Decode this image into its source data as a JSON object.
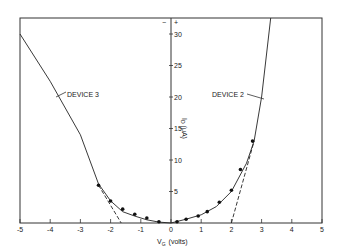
{
  "chart_data": {
    "type": "line",
    "title": "",
    "xlabel": "V_G (volts)",
    "ylabel": "I_D (μA)",
    "xlim": [
      -5,
      5
    ],
    "ylim": [
      0,
      32
    ],
    "x_ticks": [
      "-5",
      "-4",
      "-3",
      "-2",
      "-1",
      "0",
      "1",
      "2",
      "3",
      "4",
      "5"
    ],
    "y_ticks": [
      "5",
      "10",
      "15",
      "20",
      "25",
      "30"
    ],
    "sign_markers": {
      "minus": "−",
      "plus": "+"
    },
    "grid": false,
    "series": [
      {
        "name": "DEVICE 3",
        "style": "solid line",
        "x": [
          -5.0,
          -4.0,
          -3.0,
          -2.4,
          -2.0,
          -1.6,
          -1.2,
          -0.8,
          -0.4,
          0.0
        ],
        "y": [
          30.0,
          22.5,
          14.0,
          6.2,
          3.5,
          1.8,
          1.1,
          0.5,
          0.15,
          0.0
        ]
      },
      {
        "name": "DEVICE 2",
        "style": "solid line",
        "x": [
          0.0,
          0.5,
          1.0,
          1.5,
          2.0,
          2.5,
          2.75,
          3.0,
          3.3
        ],
        "y": [
          0.0,
          0.6,
          1.3,
          2.6,
          5.0,
          9.5,
          13.0,
          20.0,
          33.0
        ]
      },
      {
        "name": "Measured points",
        "style": "markers",
        "x": [
          -2.4,
          -2.0,
          -1.6,
          -1.2,
          -0.8,
          -0.4,
          0.2,
          0.5,
          0.9,
          1.2,
          1.6,
          2.0,
          2.3,
          2.7
        ],
        "y": [
          6.0,
          3.5,
          2.2,
          1.4,
          0.8,
          0.2,
          0.2,
          0.6,
          1.1,
          1.8,
          3.3,
          5.2,
          8.5,
          13.0
        ]
      },
      {
        "name": "Device 3 extrapolation",
        "style": "dashed",
        "x": [
          -2.4,
          -1.65
        ],
        "y": [
          6.0,
          0.0
        ]
      },
      {
        "name": "Device 2 extrapolation",
        "style": "dashed",
        "x": [
          2.0,
          2.75
        ],
        "y": [
          0.0,
          13.0
        ]
      }
    ],
    "annotations": [
      {
        "text": "DEVICE 3",
        "points_to": "left curve near V=-4"
      },
      {
        "text": "DEVICE 2",
        "points_to": "right curve near V=3.0"
      }
    ]
  },
  "labels": {
    "device3": "DEVICE 3",
    "device2": "DEVICE 2",
    "xlabel_main": "V",
    "xlabel_sub": "G",
    "xlabel_unit": "(volts)",
    "ylabel_main": "I",
    "ylabel_sub": "D",
    "ylabel_unit": "(μA)",
    "minus": "−",
    "plus": "+"
  }
}
